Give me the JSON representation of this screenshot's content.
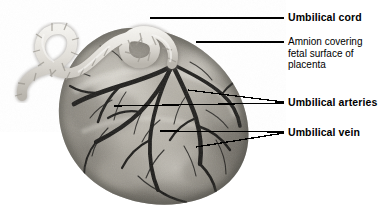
{
  "figure": {
    "background_color": "#ffffff",
    "leader_color": "#000000",
    "text_color": "#000000"
  },
  "specimen": {
    "name": "placenta-photograph",
    "description": "Grayscale photograph of a human placenta fetal surface with coiled umbilical cord",
    "disc_tone_light": "#cfccc5",
    "disc_tone_mid": "#9a968d",
    "disc_tone_dark": "#5d5a54",
    "vessel_color": "#1d1c1a",
    "cord_color": "#e8e6e1"
  },
  "labels": [
    {
      "id": "umbilical-cord",
      "text": "Umbilical cord",
      "weight": "bold",
      "x": 288,
      "y": 12
    },
    {
      "id": "amnion",
      "text": "Amnion covering\nfetal surface of\nplacenta",
      "weight": "plain",
      "x": 288,
      "y": 36
    },
    {
      "id": "umbilical-arteries",
      "text": "Umbilical arteries",
      "weight": "bold",
      "x": 288,
      "y": 97
    },
    {
      "id": "umbilical-vein",
      "text": "Umbilical vein",
      "weight": "bold",
      "x": 288,
      "y": 127
    }
  ],
  "leaders": [
    {
      "id": "leader-umbilical-cord",
      "points": "150,18 284,18"
    },
    {
      "id": "leader-amnion",
      "points": "196,42 284,42"
    },
    {
      "id": "leader-arteries-upper",
      "points": "188,90 284,102"
    },
    {
      "id": "leader-arteries-lower",
      "points": "114,106 284,103"
    },
    {
      "id": "leader-vein-upper",
      "points": "160,131 284,132"
    },
    {
      "id": "leader-vein-lower",
      "points": "196,147 284,133"
    }
  ]
}
